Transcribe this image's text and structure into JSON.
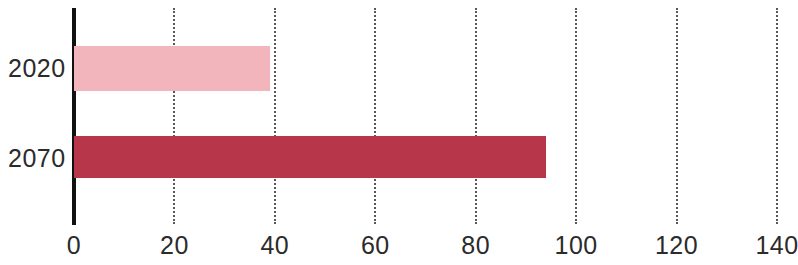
{
  "chart_data": {
    "type": "bar",
    "orientation": "horizontal",
    "title": "",
    "subtitle": "",
    "xlabel": "",
    "ylabel": "",
    "categories": [
      "2020",
      "2070"
    ],
    "values": [
      39,
      94
    ],
    "series": [
      {
        "name": "",
        "values": [
          39,
          94
        ],
        "colors": [
          "#f2b5bc",
          "#b8364a"
        ]
      }
    ],
    "xlim": [
      0,
      148
    ],
    "ylim": null,
    "x_ticks": [
      0,
      20,
      40,
      60,
      80,
      100,
      120,
      140
    ],
    "x_tick_labels": [
      "0",
      "20",
      "40",
      "60",
      "80",
      "100",
      "120",
      "140"
    ],
    "y_tick_labels": [
      "2020",
      "2070"
    ],
    "grid": "vertical-dotted",
    "legend": "none",
    "annotations": [],
    "colors": {
      "bar_2020": "#f2b5bc",
      "bar_2070": "#b8364a",
      "axis": "#111111",
      "gridline": "#3b3b3b",
      "text": "#2b2b2b",
      "background": "#ffffff"
    }
  },
  "bars": [
    {
      "category": "2020",
      "value": 39,
      "color": "#f2b5bc"
    },
    {
      "category": "2070",
      "value": 94,
      "color": "#b8364a"
    }
  ],
  "axis": {
    "ticks": [
      {
        "value": 0,
        "label": "0"
      },
      {
        "value": 20,
        "label": "20"
      },
      {
        "value": 40,
        "label": "40"
      },
      {
        "value": 60,
        "label": "60"
      },
      {
        "value": 80,
        "label": "80"
      },
      {
        "value": 100,
        "label": "100"
      },
      {
        "value": 120,
        "label": "120"
      },
      {
        "value": 140,
        "label": "140"
      }
    ]
  }
}
